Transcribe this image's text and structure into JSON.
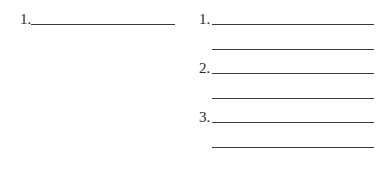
{
  "left_column": {
    "items": [
      {
        "number": "1."
      }
    ]
  },
  "right_column": {
    "items": [
      {
        "number": "1."
      },
      {
        "number": "2."
      },
      {
        "number": "3."
      }
    ]
  }
}
